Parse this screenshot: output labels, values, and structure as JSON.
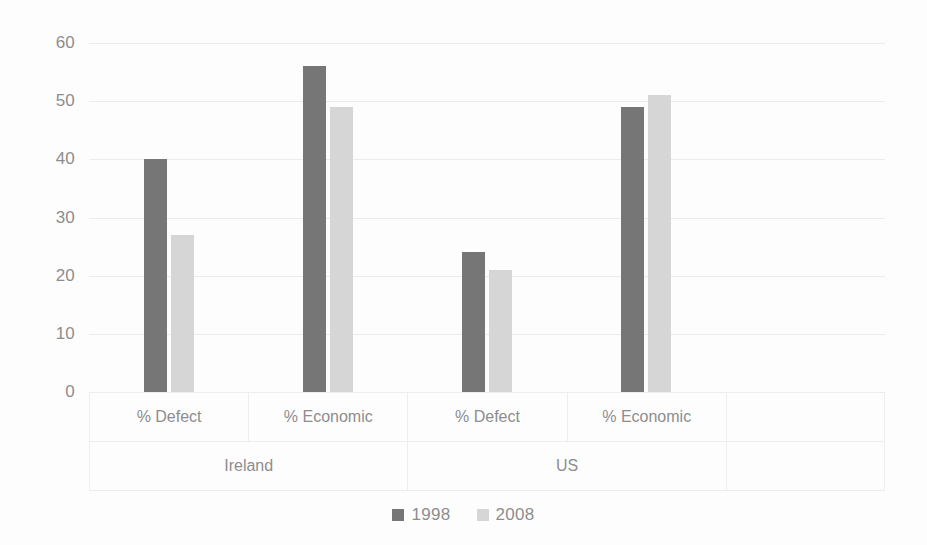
{
  "chart_data": {
    "type": "bar",
    "title": "",
    "subtitle": "",
    "xlabel": "",
    "ylabel": "",
    "ylim": [
      0,
      60
    ],
    "yticks": [
      0,
      10,
      20,
      30,
      40,
      50,
      60
    ],
    "ytick_labels": [
      "0",
      "10",
      "20",
      "30",
      "40",
      "50",
      "60"
    ],
    "grid": true,
    "legend_position": "bottom",
    "groups": [
      "Ireland",
      "US"
    ],
    "categories": [
      "% Defect",
      "% Economic",
      "% Defect",
      "% Economic"
    ],
    "category_groups": [
      "Ireland",
      "Ireland",
      "US",
      "US"
    ],
    "series": [
      {
        "name": "1998",
        "color": "#767676",
        "values": [
          40,
          56,
          24,
          49
        ]
      },
      {
        "name": "2008",
        "color": "#d6d6d6",
        "values": [
          27,
          49,
          21,
          51
        ]
      }
    ],
    "annotations": []
  },
  "axis": {
    "y_ticks": [
      {
        "label": "60",
        "value": 60
      },
      {
        "label": "50",
        "value": 50
      },
      {
        "label": "40",
        "value": 40
      },
      {
        "label": "30",
        "value": 30
      },
      {
        "label": "20",
        "value": 20
      },
      {
        "label": "10",
        "value": 10
      },
      {
        "label": "0",
        "value": 0
      }
    ],
    "categories": [
      {
        "label": "% Defect",
        "group": "Ireland"
      },
      {
        "label": "% Economic",
        "group": "Ireland"
      },
      {
        "label": "% Defect",
        "group": "US"
      },
      {
        "label": "% Economic",
        "group": "US"
      },
      {
        "label": "",
        "group": ""
      }
    ],
    "groups": [
      {
        "label": "Ireland",
        "span": 2
      },
      {
        "label": "US",
        "span": 2
      },
      {
        "label": "",
        "span": 1
      }
    ]
  },
  "legend": {
    "items": [
      {
        "label": "1998",
        "color": "#767676"
      },
      {
        "label": "2008",
        "color": "#d6d6d6"
      }
    ]
  },
  "colors": {
    "series_1998": "#767676",
    "series_2008": "#d6d6d6",
    "gridline": "#ececec",
    "text": "#8d8d8d",
    "background": "#fdfdfd"
  }
}
